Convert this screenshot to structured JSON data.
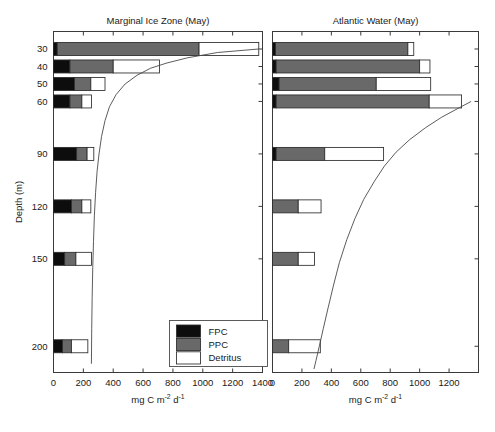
{
  "figure": {
    "ylabel": "Depth (m)",
    "legend": {
      "title": "",
      "entries": [
        {
          "label": "FPC",
          "color": "#0d0d0d"
        },
        {
          "label": "PPC",
          "color": "#696969"
        },
        {
          "label": "Detritus",
          "color": "#ffffff"
        }
      ]
    }
  },
  "chart_data": [
    {
      "type": "bar",
      "orientation": "horizontal",
      "stacked": true,
      "title": "Marginal Ice Zone (May)",
      "xlabel": "mg C m-2 d-1",
      "xlabel_parts": {
        "pre": "mg C m",
        "sup1": "-2",
        "mid": " d",
        "sup2": "-1"
      },
      "ylabel": "Depth (m)",
      "xlim": [
        0,
        1400
      ],
      "xticks": [
        0,
        200,
        400,
        600,
        800,
        1000,
        1200,
        1400
      ],
      "xticklabels": [
        "0",
        "200",
        "400",
        "600",
        "800",
        "1000",
        "1200",
        "1400"
      ],
      "ylim": [
        20,
        215
      ],
      "yticks": [
        30,
        40,
        50,
        60,
        90,
        120,
        150,
        200
      ],
      "yticklabels": [
        "30",
        "40",
        "50",
        "60",
        "90",
        "120",
        "150",
        "200"
      ],
      "grid": false,
      "legend_position": "lower-center",
      "categories": [
        30,
        40,
        50,
        60,
        90,
        120,
        150,
        200
      ],
      "series": [
        {
          "name": "FPC",
          "values": [
            25,
            110,
            140,
            110,
            155,
            120,
            75,
            60
          ]
        },
        {
          "name": "PPC",
          "values": [
            950,
            290,
            110,
            80,
            70,
            70,
            75,
            60
          ]
        },
        {
          "name": "Detritus",
          "values": [
            400,
            310,
            95,
            65,
            45,
            60,
            105,
            110
          ]
        }
      ],
      "totals": [
        1375,
        710,
        345,
        255,
        270,
        250,
        255,
        230
      ],
      "overlay_curve": {
        "name": "cumulative flux curve",
        "points": [
          [
            1375,
            30
          ],
          [
            1100,
            32
          ],
          [
            900,
            35
          ],
          [
            760,
            38
          ],
          [
            650,
            41
          ],
          [
            560,
            45
          ],
          [
            480,
            50
          ],
          [
            420,
            56
          ],
          [
            375,
            63
          ],
          [
            345,
            71
          ],
          [
            322,
            80
          ],
          [
            305,
            90
          ],
          [
            292,
            100
          ],
          [
            282,
            112
          ],
          [
            274,
            125
          ],
          [
            268,
            140
          ],
          [
            263,
            155
          ],
          [
            259,
            172
          ],
          [
            256,
            190
          ],
          [
            254,
            210
          ]
        ]
      }
    },
    {
      "type": "bar",
      "orientation": "horizontal",
      "stacked": true,
      "title": "Atlantic Water (May)",
      "xlabel": "mg C m-2 d-1",
      "xlabel_parts": {
        "pre": "mg C m",
        "sup1": "-2",
        "mid": " d",
        "sup2": "-1"
      },
      "ylabel": "Depth (m)",
      "xlim": [
        0,
        1400
      ],
      "xticks": [
        0,
        200,
        400,
        600,
        800,
        1000,
        1200
      ],
      "xticklabels": [
        "0",
        "200",
        "400",
        "600",
        "800",
        "1000",
        "1200"
      ],
      "ylim": [
        20,
        215
      ],
      "yticks": [
        30,
        40,
        50,
        60,
        90,
        120,
        150,
        200
      ],
      "yticklabels": [
        "30",
        "40",
        "50",
        "60",
        "90",
        "120",
        "150",
        "200"
      ],
      "grid": false,
      "legend_position": "none",
      "categories": [
        30,
        40,
        50,
        60,
        90,
        120,
        150,
        200
      ],
      "series": [
        {
          "name": "FPC",
          "values": [
            20,
            25,
            45,
            25,
            25,
            0,
            0,
            0
          ]
        },
        {
          "name": "PPC",
          "values": [
            900,
            975,
            660,
            1040,
            330,
            175,
            175,
            110
          ]
        },
        {
          "name": "Detritus",
          "values": [
            40,
            70,
            370,
            220,
            400,
            155,
            110,
            215
          ]
        }
      ],
      "totals": [
        960,
        1070,
        1075,
        1285,
        755,
        330,
        285,
        325
      ],
      "overlay_curve": {
        "name": "cumulative flux curve",
        "points": [
          [
            1350,
            60
          ],
          [
            1260,
            64
          ],
          [
            1150,
            69
          ],
          [
            1040,
            75
          ],
          [
            930,
            82
          ],
          [
            840,
            89
          ],
          [
            760,
            97
          ],
          [
            690,
            106
          ],
          [
            620,
            116
          ],
          [
            560,
            127
          ],
          [
            505,
            139
          ],
          [
            455,
            152
          ],
          [
            415,
            165
          ],
          [
            378,
            178
          ],
          [
            345,
            190
          ],
          [
            318,
            200
          ],
          [
            296,
            208
          ],
          [
            282,
            213
          ]
        ]
      }
    }
  ]
}
